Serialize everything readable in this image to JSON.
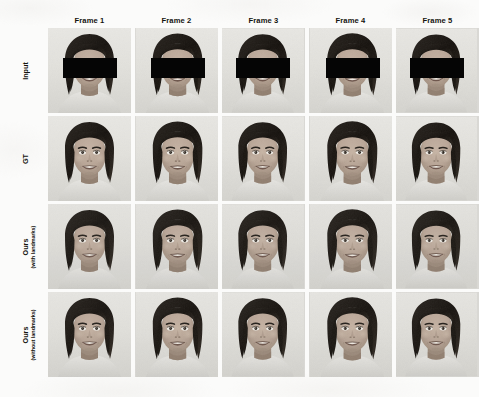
{
  "figure": {
    "name": "qualitative-comparison-grid",
    "kind": "image-grid",
    "background_color": "#fbfbfa",
    "text_color": "#14140f",
    "columns": [
      {
        "id": "frame1",
        "label": "Frame 1"
      },
      {
        "id": "frame2",
        "label": "Frame 2"
      },
      {
        "id": "frame3",
        "label": "Frame 3"
      },
      {
        "id": "frame4",
        "label": "Frame 4"
      },
      {
        "id": "frame5",
        "label": "Frame 5"
      }
    ],
    "rows": [
      {
        "id": "input",
        "label": "Input",
        "sublabel": "",
        "censored": true,
        "style": "sharp"
      },
      {
        "id": "gt",
        "label": "GT",
        "sublabel": "",
        "censored": false,
        "style": "sharp"
      },
      {
        "id": "ours-with",
        "label": "Ours",
        "sublabel": "(with landmarks)",
        "censored": false,
        "style": "soft"
      },
      {
        "id": "ours-without",
        "label": "Ours",
        "sublabel": "(without landmarks)",
        "censored": false,
        "style": "soft2"
      }
    ],
    "cells": [
      {
        "row": "input",
        "col": "frame1",
        "caption": "Input frame 1, eyes masked"
      },
      {
        "row": "input",
        "col": "frame2",
        "caption": "Input frame 2, eyes masked"
      },
      {
        "row": "input",
        "col": "frame3",
        "caption": "Input frame 3, eyes masked"
      },
      {
        "row": "input",
        "col": "frame4",
        "caption": "Input frame 4, eyes masked"
      },
      {
        "row": "input",
        "col": "frame5",
        "caption": "Input frame 5, eyes masked"
      },
      {
        "row": "gt",
        "col": "frame1",
        "caption": "Ground truth frame 1"
      },
      {
        "row": "gt",
        "col": "frame2",
        "caption": "Ground truth frame 2"
      },
      {
        "row": "gt",
        "col": "frame3",
        "caption": "Ground truth frame 3"
      },
      {
        "row": "gt",
        "col": "frame4",
        "caption": "Ground truth frame 4"
      },
      {
        "row": "gt",
        "col": "frame5",
        "caption": "Ground truth frame 5"
      },
      {
        "row": "ours-with",
        "col": "frame1",
        "caption": "Ours with landmarks frame 1"
      },
      {
        "row": "ours-with",
        "col": "frame2",
        "caption": "Ours with landmarks frame 2"
      },
      {
        "row": "ours-with",
        "col": "frame3",
        "caption": "Ours with landmarks frame 3"
      },
      {
        "row": "ours-with",
        "col": "frame4",
        "caption": "Ours with landmarks frame 4"
      },
      {
        "row": "ours-with",
        "col": "frame5",
        "caption": "Ours with landmarks frame 5"
      },
      {
        "row": "ours-without",
        "col": "frame1",
        "caption": "Ours without landmarks frame 1"
      },
      {
        "row": "ours-without",
        "col": "frame2",
        "caption": "Ours without landmarks frame 2"
      },
      {
        "row": "ours-without",
        "col": "frame3",
        "caption": "Ours without landmarks frame 3"
      },
      {
        "row": "ours-without",
        "col": "frame4",
        "caption": "Ours without landmarks frame 4"
      },
      {
        "row": "ours-without",
        "col": "frame5",
        "caption": "Ours without landmarks frame 5"
      }
    ],
    "geometry": {
      "grid_left": 48,
      "grid_top": 28,
      "cell_width": 83,
      "cell_height": 85,
      "col_gap": 4,
      "row_gap": 3,
      "header_top": 15,
      "label_column_center": 31
    },
    "censor_color": "#050505"
  }
}
